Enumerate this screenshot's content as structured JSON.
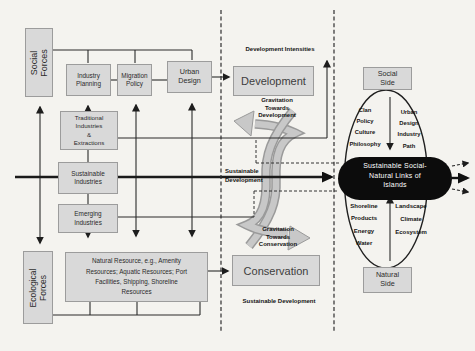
{
  "colors": {
    "background": "#f4f3ef",
    "box_fill": "#d9d9d9",
    "box_border": "#9c9c9c",
    "line": "#2a2a2a",
    "ribbon_fill": "#c8c8c8",
    "ribbon_edge": "#9a9a9a",
    "hub_fill": "#0c0c0c",
    "hub_text": "#ffffff"
  },
  "social_system": {
    "social_forces": "Social Forces",
    "industry_planning": "Industry\nPlanning",
    "migration_policy": "Migration\nPolicy",
    "urban_design": "Urban\nDesign"
  },
  "industries": {
    "traditional": "Traditional\nIndustries\n&\nExtractions",
    "sustainable": "Sustainable\nIndustries",
    "emerging": "Emerging\nIndustries"
  },
  "ecological_system": {
    "ecological_forces": "Ecological\nForces",
    "natural_resource": "Natural Resource, e.g., Amenity\nResources; Aquatic Resources; Port\nFacilities, Shipping, Shoreline\nResources"
  },
  "center": {
    "development_intensities": "Development Intensities",
    "development": "Development",
    "gravitation_towards_development": "Gravitation\nTowards\nDevelopment",
    "sustainable_development_mid": "Sustainable\nDevelopment",
    "gravitation_towards_conservation": "Gravitation\nTowards\nConservation",
    "conservation": "Conservation",
    "sustainable_development_footer": "Sustainable Development"
  },
  "island_links": {
    "social_side": "Social\nSide",
    "social_left_items": "Clan\nPolicy\nCulture\nPhilosophy",
    "social_right_items": "Urban\nDesign\nIndustry\nPath",
    "hub": "Sustainable Social-\nNatural Links of\nIslands",
    "natural_left_items": "Shoreline\nProducts\nEnergy\nWater",
    "natural_right_items": "Landscape\nClimate\nEcosystem",
    "natural_side": "Natural\nSide"
  }
}
